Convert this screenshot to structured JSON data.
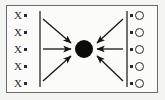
{
  "diagram": {
    "border_color": "#6a6a6a",
    "ink_color": "#2a2a2a",
    "hub": {
      "name": "central-node",
      "fill": "#0b0b0b",
      "shape": "filled-circle",
      "label": ""
    },
    "left_group": {
      "name": "left-source-column",
      "separator": "vertical-bar",
      "items": [
        {
          "symbol": "X",
          "mark": "."
        },
        {
          "symbol": "X",
          "mark": "."
        },
        {
          "symbol": "X",
          "mark": "."
        },
        {
          "symbol": "X",
          "mark": "."
        },
        {
          "symbol": "X",
          "mark": "."
        }
      ]
    },
    "right_group": {
      "name": "right-target-column",
      "separator": "vertical-bar",
      "items": [
        {
          "mark": ".",
          "symbol": "O"
        },
        {
          "mark": ".",
          "symbol": "O"
        },
        {
          "mark": ".",
          "symbol": "O"
        },
        {
          "mark": ".",
          "symbol": "O"
        },
        {
          "mark": ".",
          "symbol": "O"
        }
      ]
    },
    "arrows": [
      {
        "name": "arrow-left-top",
        "from": [
          42,
          19
        ],
        "to": [
          72,
          44
        ],
        "direction": "into-hub"
      },
      {
        "name": "arrow-left-middle",
        "from": [
          42,
          49
        ],
        "to": [
          72,
          49
        ],
        "direction": "into-hub"
      },
      {
        "name": "arrow-left-bottom",
        "from": [
          42,
          80
        ],
        "to": [
          72,
          55
        ],
        "direction": "into-hub"
      },
      {
        "name": "arrow-right-top",
        "from": [
          124,
          19
        ],
        "to": [
          96,
          44
        ],
        "direction": "into-hub"
      },
      {
        "name": "arrow-right-middle",
        "from": [
          124,
          49
        ],
        "to": [
          96,
          49
        ],
        "direction": "into-hub"
      },
      {
        "name": "arrow-right-bottom",
        "from": [
          124,
          80
        ],
        "to": [
          96,
          55
        ],
        "direction": "into-hub"
      }
    ]
  }
}
